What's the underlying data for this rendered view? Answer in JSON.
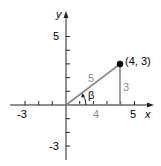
{
  "diagram": {
    "axes": {
      "x_label": "x",
      "y_label": "y",
      "x_ticks_labeled": [
        "-3",
        "5"
      ],
      "y_ticks_labeled": [
        "5",
        "-3"
      ]
    },
    "point": {
      "label": "(4, 3)",
      "x": 4,
      "y": 3
    },
    "triangle": {
      "hypotenuse_label": "5",
      "vertical_leg_label": "3",
      "horizontal_leg_label": "4",
      "angle_label": "β"
    },
    "colors": {
      "axis": "#222222",
      "triangle": "#8a8a8a",
      "triangle_label": "#8a8a8a",
      "point": "#000000"
    }
  }
}
